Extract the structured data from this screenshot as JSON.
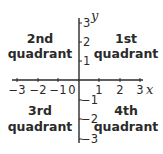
{
  "diagram": {
    "axes": {
      "x_label": "x",
      "y_label": "y",
      "x_ticks": [
        "−3",
        "−2",
        "−1",
        "0",
        "1",
        "2",
        "3"
      ],
      "y_ticks_positive": [
        "3",
        "2",
        "1"
      ],
      "y_ticks_negative": [
        "−1",
        "−2",
        "−3"
      ]
    },
    "quadrants": [
      {
        "id": "q2",
        "line1": "2nd",
        "line2": "quadrant"
      },
      {
        "id": "q1",
        "line1": "1st",
        "line2": "quadrant"
      },
      {
        "id": "q3",
        "line1": "3rd",
        "line2": "quadrant"
      },
      {
        "id": "q4",
        "line1": "4th",
        "line2": "quadrant"
      }
    ],
    "colors": {
      "ink": "#2a2a2a",
      "background": "#ffffff"
    }
  }
}
